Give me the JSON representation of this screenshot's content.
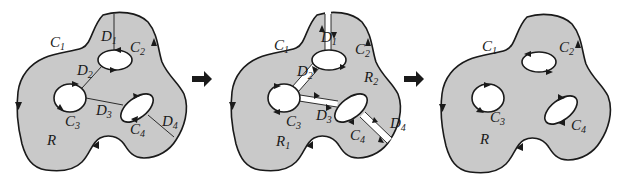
{
  "figure": {
    "colors": {
      "region_fill": "#c9c9c9",
      "stroke": "#1a1a1a",
      "background": "#ffffff"
    },
    "panels": [
      {
        "id": "panel-1",
        "labels": {
          "C1": "C",
          "C1_sub": "1",
          "C2": "C",
          "C2_sub": "2",
          "C3": "C",
          "C3_sub": "3",
          "C4": "C",
          "C4_sub": "4",
          "D1": "D",
          "D1_sub": "1",
          "D2": "D",
          "D2_sub": "2",
          "D3": "D",
          "D3_sub": "3",
          "D4": "D",
          "D4_sub": "4",
          "R": "R"
        }
      },
      {
        "id": "panel-2",
        "labels": {
          "C1": "C",
          "C1_sub": "1",
          "C2": "C",
          "C2_sub": "2",
          "C3": "C",
          "C3_sub": "3",
          "C4": "C",
          "C4_sub": "4",
          "D1": "D",
          "D1_sub": "1",
          "D2": "D",
          "D2_sub": "2",
          "D3": "D",
          "D3_sub": "3",
          "D4": "D",
          "D4_sub": "4",
          "R1": "R",
          "R1_sub": "1",
          "R2": "R",
          "R2_sub": "2"
        }
      },
      {
        "id": "panel-3",
        "labels": {
          "C1": "C",
          "C1_sub": "1",
          "C2": "C",
          "C2_sub": "2",
          "C3": "C",
          "C3_sub": "3",
          "C4": "C",
          "C4_sub": "4",
          "R": "R"
        }
      }
    ],
    "transition_arrows": [
      "right-arrow",
      "right-arrow"
    ]
  }
}
